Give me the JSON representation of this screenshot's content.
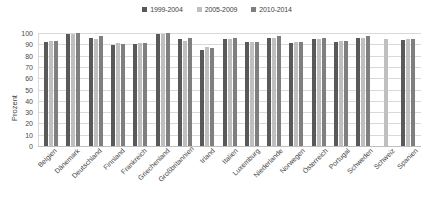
{
  "chart_data": {
    "type": "bar",
    "title": "",
    "subtitle": "",
    "xlabel": "",
    "ylabel": "Prozent",
    "ylim": [
      0,
      100
    ],
    "y_ticks": [
      100,
      90,
      80,
      70,
      60,
      50,
      40,
      30,
      20,
      10,
      0
    ],
    "grid": true,
    "legend_position": "top-center",
    "categories": [
      "Belgien",
      "Dänemark",
      "Deutschland",
      "Finnland",
      "Frankreich",
      "Griechenland",
      "Großbritannien",
      "Irland",
      "Italien",
      "Luxemburg",
      "Niederlande",
      "Norwegen",
      "Österreich",
      "Portugal",
      "Schweden",
      "Schweiz",
      "Spanien"
    ],
    "series": [
      {
        "name": "1999-2004",
        "color": "#595959",
        "values": [
          92,
          99,
          96,
          89,
          90,
          99,
          95,
          85,
          95,
          92,
          96,
          91,
          95,
          92,
          96,
          null,
          94
        ]
      },
      {
        "name": "2005-2009",
        "color": "#bfbfbf",
        "values": [
          93,
          99,
          95,
          91,
          91,
          99,
          93,
          88,
          95,
          92,
          96,
          92,
          95,
          93,
          96,
          95,
          95
        ]
      },
      {
        "name": "2010-2014",
        "color": "#7f7f7f",
        "values": [
          93,
          100,
          97,
          90,
          91,
          100,
          96,
          87,
          96,
          92,
          97,
          92,
          96,
          93,
          97,
          null,
          95
        ]
      }
    ]
  },
  "legend": {
    "items": [
      {
        "label": "1999-2004",
        "color": "#595959"
      },
      {
        "label": "2005-2009",
        "color": "#bfbfbf"
      },
      {
        "label": "2010-2014",
        "color": "#7f7f7f"
      }
    ]
  },
  "axes": {
    "y_title": "Prozent"
  }
}
